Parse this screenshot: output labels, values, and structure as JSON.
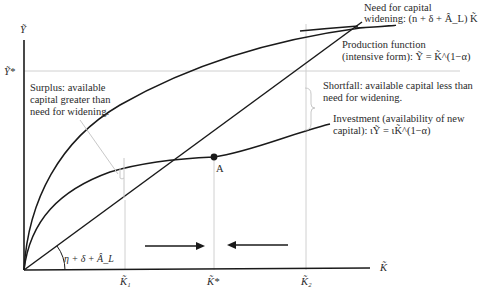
{
  "axes": {
    "y_label": "Ỹ",
    "x_label": "K̃",
    "y_star_label": "Ỹ*"
  },
  "annotations": {
    "capital_widening": {
      "line1": "Need for capital",
      "line2": "widening:  (n + δ + Â_L) K̃"
    },
    "production": {
      "line1": "Production function",
      "line2": "(intensive form):  Ỹ = K̃^(1−α)"
    },
    "shortfall": {
      "line1": "Shortfall: available capital less than",
      "line2": "need for widening."
    },
    "investment": {
      "line1": "Investment (availability of new",
      "line2": "capital):  ιỸ = ιK̃^(1−α)"
    },
    "surplus": {
      "line1": "Surplus: available",
      "line2": "capital greater than",
      "line3": "need for widening."
    },
    "slope_label": "η + δ + Â_L",
    "point_label": "A"
  },
  "x_ticks": {
    "k1": "K̃₁",
    "kstar": "K̃*",
    "k2": "K̃₂"
  },
  "colors": {
    "curve": "#1a1a1a",
    "guide": "#c8c8c8",
    "text": "#2a2a2a"
  }
}
